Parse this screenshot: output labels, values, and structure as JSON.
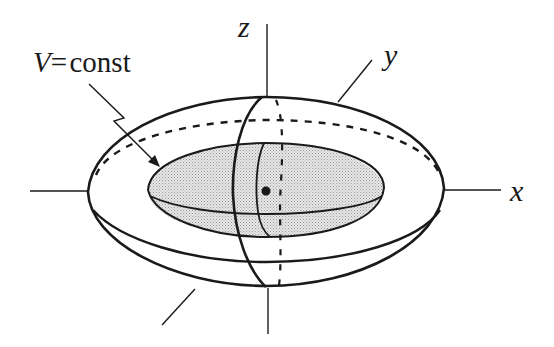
{
  "figure": {
    "caption_label": {
      "symbol": "V",
      "equals": "=",
      "text": "const"
    },
    "axes": {
      "x": "x",
      "y": "y",
      "z": "z"
    },
    "colors": {
      "stroke": "#1a1a1a",
      "shading": "#d9d9d9",
      "background": "#ffffff"
    },
    "elements": [
      "outer ellipsoid (oblate spheroid)",
      "inner equipotential surface V = const (shaded)",
      "meridian section",
      "hidden (dashed) back equator and meridian",
      "center mass point"
    ]
  }
}
